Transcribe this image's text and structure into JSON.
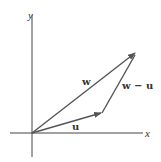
{
  "diagram": {
    "axes": {
      "x_label": "x",
      "y_label": "y"
    },
    "vectors": [
      {
        "name": "w",
        "label": "w",
        "from": "origin",
        "to": "w_tip"
      },
      {
        "name": "u",
        "label": "u",
        "from": "origin",
        "to": "u_tip"
      },
      {
        "name": "w-u",
        "label": "w − u",
        "from": "u_tip",
        "to": "w_tip"
      }
    ],
    "colors": {
      "axis": "#444444",
      "vector": "#555555",
      "text": "#333333"
    }
  }
}
